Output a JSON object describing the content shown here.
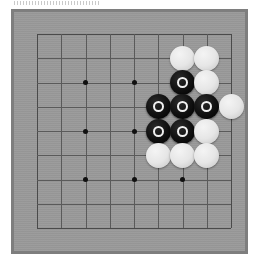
{
  "app": {
    "title": "Go board position",
    "board_label": "goban"
  },
  "colors": {
    "page_background": "#ffffff",
    "board_frame": "#7e7e7e",
    "board_surface": "#999999",
    "grid_line": "#5a5a5a",
    "star_point": "#101010",
    "white_stone": "#e8e8e8",
    "black_stone": "#0d0d0d",
    "marker_on_black": "#f0f0f0"
  },
  "board": {
    "size": 9,
    "frame": {
      "left": 11,
      "top": 9,
      "width": 237,
      "height": 245
    },
    "grid": {
      "origin_x": 23,
      "origin_y": 22,
      "spacing": 24.25,
      "lines": 9
    },
    "stone_diameter": 25,
    "star_points": [
      {
        "col": 2,
        "row": 2
      },
      {
        "col": 4,
        "row": 2
      },
      {
        "col": 2,
        "row": 4
      },
      {
        "col": 4,
        "row": 4
      },
      {
        "col": 2,
        "row": 6
      },
      {
        "col": 4,
        "row": 6
      },
      {
        "col": 6,
        "row": 6
      }
    ],
    "stones": [
      {
        "col": 6,
        "row": 1,
        "color": "white",
        "marked": false
      },
      {
        "col": 7,
        "row": 1,
        "color": "white",
        "marked": false
      },
      {
        "col": 6,
        "row": 2,
        "color": "black",
        "marked": true
      },
      {
        "col": 7,
        "row": 2,
        "color": "white",
        "marked": false
      },
      {
        "col": 5,
        "row": 3,
        "color": "black",
        "marked": true
      },
      {
        "col": 6,
        "row": 3,
        "color": "black",
        "marked": true
      },
      {
        "col": 7,
        "row": 3,
        "color": "black",
        "marked": true
      },
      {
        "col": 8,
        "row": 3,
        "color": "white",
        "marked": false
      },
      {
        "col": 5,
        "row": 4,
        "color": "black",
        "marked": true
      },
      {
        "col": 6,
        "row": 4,
        "color": "black",
        "marked": true
      },
      {
        "col": 7,
        "row": 4,
        "color": "white",
        "marked": false
      },
      {
        "col": 5,
        "row": 5,
        "color": "white",
        "marked": false
      },
      {
        "col": 6,
        "row": 5,
        "color": "white",
        "marked": false
      },
      {
        "col": 7,
        "row": 5,
        "color": "white",
        "marked": false
      }
    ]
  }
}
